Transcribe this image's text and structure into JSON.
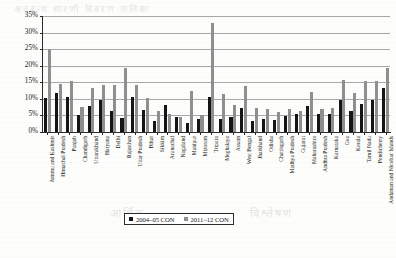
{
  "chart_data": {
    "type": "bar",
    "title": "",
    "xlabel": "",
    "ylabel": "",
    "ylim": [
      0,
      35
    ],
    "ytick_labels": [
      "0%",
      "5%",
      "10%",
      "15%",
      "20%",
      "25%",
      "30%",
      "35%"
    ],
    "ytick_values": [
      0,
      5,
      10,
      15,
      20,
      25,
      30,
      35
    ],
    "grid": true,
    "legend_position": "bottom-center",
    "categories": [
      "Jammu and Kashmir",
      "Himachal Pradesh",
      "Punjab",
      "Chandigarh",
      "Uttarakhand",
      "Haryana",
      "Delhi",
      "Rajasthan",
      "Uttar Pradesh",
      "Bihar",
      "Sikkim",
      "Arunachal",
      "Nagaland",
      "Manipur",
      "Mizoram",
      "Tripura",
      "Meghalaya",
      "Assam",
      "West Bengal",
      "Jharkhand",
      "Odisha",
      "Chattisgarh",
      "Madhya Pradesh",
      "Gujarat",
      "Maharashtra",
      "Andhra Pradesh",
      "Karnataka",
      "Goa",
      "Kerala",
      "Tamil Nadu",
      "Pondicherry",
      "Andaman and Nicobar Islands"
    ],
    "series": [
      {
        "name": "2004–05 CON",
        "color": "#151515",
        "values": [
          10.4,
          11.8,
          10.5,
          5.1,
          7.8,
          9.6,
          6.3,
          4.1,
          10.7,
          6.6,
          3.3,
          8.1,
          4.6,
          2.6,
          3.8,
          10.7,
          4.0,
          4.6,
          7.2,
          3.3,
          3.9,
          3.6,
          4.7,
          5.3,
          7.9,
          5.3,
          5.5,
          9.6,
          6.3,
          8.5,
          9.6,
          13.4
        ]
      },
      {
        "name": "2011–12 CON",
        "color": "#8f8f8f",
        "values": [
          24.9,
          14.4,
          15.4,
          7.5,
          13.3,
          14.3,
          14.2,
          19.3,
          14.2,
          10.3,
          6.3,
          5.5,
          4.5,
          12.5,
          5.1,
          33.0,
          11.4,
          8.3,
          13.8,
          7.1,
          6.9,
          6.0,
          6.8,
          6.3,
          12.0,
          6.8,
          7.3,
          15.8,
          11.9,
          15.5,
          15.3,
          19.2
        ]
      }
    ]
  },
  "legend": {
    "items": [
      {
        "label": "2004–05 CON",
        "color": "#151515"
      },
      {
        "label": "2011–12 CON",
        "color": "#8f8f8f"
      }
    ]
  },
  "page_bleed": {
    "top": "अनुबन्ध  सारणी  विवरण  तालिका",
    "mid_left": "आर्थिक",
    "mid_right": "विश्लेषण"
  }
}
